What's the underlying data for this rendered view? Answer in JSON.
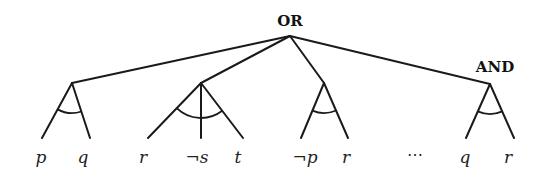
{
  "diagram": {
    "type": "and-or-tree",
    "root": {
      "label": "OR",
      "x": 290,
      "y": 36,
      "label_x": 290,
      "label_y": 26
    },
    "and_label": {
      "label": "AND",
      "x": 495,
      "y": 72
    },
    "ellipsis": "⋯",
    "branches": [
      {
        "apex": [
          72,
          83
        ],
        "arc": {
          "r": 30
        },
        "leaves": [
          {
            "label": "p",
            "line_end": [
              42,
              138
            ],
            "label_pos": [
              41,
              163
            ]
          },
          {
            "label": "q",
            "line_end": [
              90,
              138
            ],
            "label_pos": [
              83,
              163
            ]
          }
        ]
      },
      {
        "apex": [
          201,
          83
        ],
        "arc": {
          "r": 35
        },
        "leaves": [
          {
            "label": "r",
            "line_end": [
              148,
              138
            ],
            "label_pos": [
              143,
              163
            ]
          },
          {
            "label": "¬s",
            "line_end": [
              201,
              138
            ],
            "label_pos": [
              197,
              163
            ]
          },
          {
            "label": "t",
            "line_end": [
              243,
              138
            ],
            "label_pos": [
              238,
              163
            ]
          }
        ]
      },
      {
        "apex": [
          324,
          83
        ],
        "arc": {
          "r": 30
        },
        "leaves": [
          {
            "label": "¬p",
            "line_end": [
              301,
              138
            ],
            "label_pos": [
              305,
              163
            ]
          },
          {
            "label": "r",
            "line_end": [
              348,
              138
            ],
            "label_pos": [
              346,
              163
            ]
          }
        ]
      },
      {
        "apex": [
          490,
          84
        ],
        "arc": {
          "r": 30
        },
        "leaves": [
          {
            "label": "q",
            "line_end": [
              466,
              138
            ],
            "label_pos": [
              465,
              163
            ]
          },
          {
            "label": "r",
            "line_end": [
              514,
              138
            ],
            "label_pos": [
              508,
              163
            ]
          }
        ]
      }
    ],
    "ellipsis_pos": [
      415,
      160
    ]
  }
}
